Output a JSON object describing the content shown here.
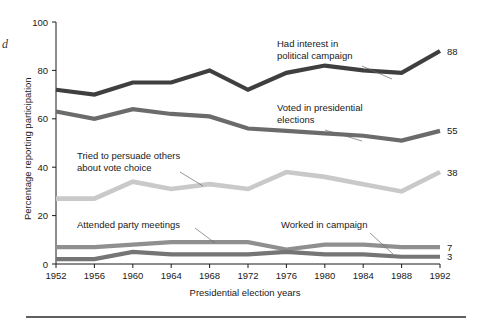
{
  "edge_fragment": "d",
  "chart_data": {
    "type": "line",
    "title": "",
    "xlabel": "Presidential election years",
    "ylabel": "Percentage reporting participation",
    "categories": [
      1952,
      1956,
      1960,
      1964,
      1968,
      1972,
      1976,
      1980,
      1984,
      1988,
      1992
    ],
    "xtick_labels": [
      "1952",
      "1956",
      "1960",
      "1964",
      "1968",
      "1972",
      "1976",
      "1980",
      "1984",
      "1988",
      "1992"
    ],
    "ytick_labels": [
      "0",
      "20",
      "40",
      "60",
      "80",
      "100"
    ],
    "yticks": [
      0,
      20,
      40,
      60,
      80,
      100
    ],
    "ylim": [
      0,
      100
    ],
    "grid": false,
    "legend_position": "inline-annotations",
    "series": [
      {
        "name": "Had interest in political campaign",
        "label": "Had interest in",
        "label_line2": "political campaign",
        "color": "#3f3f3f",
        "width": 4.2,
        "values": [
          72,
          70,
          75,
          75,
          80,
          72,
          79,
          82,
          80,
          79,
          88
        ],
        "end_value": "88"
      },
      {
        "name": "Voted in presidential elections",
        "label": "Voted in presidential",
        "label_line2": "elections",
        "color": "#6b6b6b",
        "width": 4.2,
        "values": [
          63,
          60,
          64,
          62,
          61,
          56,
          55,
          54,
          53,
          51,
          55
        ],
        "end_value": "55"
      },
      {
        "name": "Tried to persuade others about vote choice",
        "label": "Tried to persuade others",
        "label_line2": "about vote choice",
        "color": "#c9c9c9",
        "width": 4.6,
        "values": [
          27,
          27,
          34,
          31,
          33,
          31,
          38,
          36,
          33,
          30,
          38
        ],
        "end_value": "38"
      },
      {
        "name": "Attended party meetings",
        "label": "Attended party meetings",
        "label_line2": "",
        "color": "#8f8f8f",
        "width": 4.2,
        "values": [
          7,
          7,
          8,
          9,
          9,
          9,
          6,
          8,
          8,
          7,
          7
        ],
        "end_value": "7"
      },
      {
        "name": "Worked in campaign",
        "label": "Worked in campaign",
        "label_line2": "",
        "color": "#757575",
        "width": 4.2,
        "values": [
          2,
          2,
          5,
          4,
          4,
          4,
          5,
          4,
          4,
          3,
          3
        ],
        "end_value": "3"
      }
    ],
    "annotations": [
      {
        "name": "annotation-had-interest",
        "text_line1": "Had interest in",
        "text_line2": "political campaign",
        "text_x": 277,
        "text_y": 47,
        "leader": "M 362 66 L 392 79"
      },
      {
        "name": "annotation-voted",
        "text_line1": "Voted in presidential",
        "text_line2": "elections",
        "text_x": 277,
        "text_y": 111,
        "leader": "M 325 130 L 362 141"
      },
      {
        "name": "annotation-persuade",
        "text_line1": "Tried to persuade others",
        "text_line2": "about vote choice",
        "text_x": 77,
        "text_y": 159,
        "leader": "M 180 172 L 203 186"
      },
      {
        "name": "annotation-attended",
        "text_line1": "Attended party meetings",
        "text_line2": "",
        "text_x": 77,
        "text_y": 228,
        "leader": "M 195 228 L 215 243"
      },
      {
        "name": "annotation-worked",
        "text_line1": "Worked in campaign",
        "text_line2": "",
        "text_x": 281,
        "text_y": 228,
        "leader": "M 370 233 L 393 254"
      }
    ]
  }
}
